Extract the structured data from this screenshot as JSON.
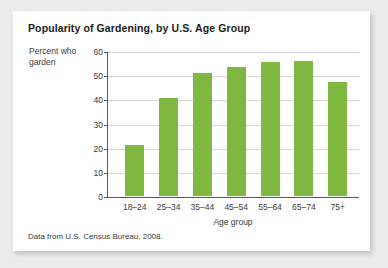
{
  "card": {
    "title": "Popularity of Gardening, by U.S. Age Group",
    "source_note": "Data from U.S. Census Bureau, 2008."
  },
  "chart_data": {
    "type": "bar",
    "title": "Popularity of Gardening, by U.S. Age Group",
    "subtitle": "",
    "categories": [
      "18–24",
      "25–34",
      "35–44",
      "45–54",
      "55–64",
      "65–74",
      "75+"
    ],
    "values": [
      21,
      40.5,
      51,
      53.5,
      55.5,
      56,
      47
    ],
    "series": [
      {
        "name": "Percent who garden",
        "values": [
          21,
          40.5,
          51,
          53.5,
          55.5,
          56,
          47
        ]
      }
    ],
    "xlabel": "Age group",
    "ylabel": "Percent who garden",
    "ylim": [
      0,
      60
    ],
    "yticks": [
      0,
      10,
      20,
      30,
      40,
      50,
      60
    ],
    "ytick_labels": [
      "0",
      "10",
      "20",
      "30",
      "40",
      "50",
      "60"
    ],
    "grid": true,
    "legend": false,
    "legend_position": "none",
    "bar_color": "#7FB83F",
    "annotations": [
      "Data from U.S. Census Bureau, 2008."
    ]
  }
}
